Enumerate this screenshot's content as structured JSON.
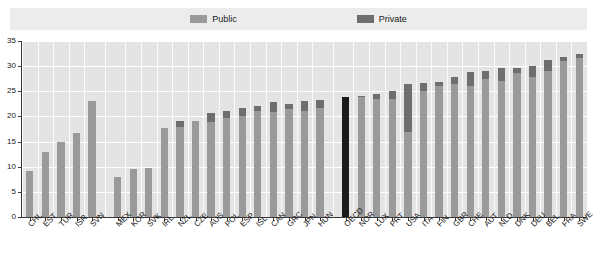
{
  "legend": {
    "entries": [
      {
        "label": "Public",
        "color": "#9a9a9a",
        "icon": "legend-swatch-public"
      },
      {
        "label": "Private",
        "color": "#6e6e6e",
        "icon": "legend-swatch-private"
      }
    ]
  },
  "colors": {
    "public": "#9a9a9a",
    "private": "#6e6e6e",
    "highlight": "#1a1a1a",
    "plot_background": "#e4e4e4",
    "gridline": "#ffffff",
    "axis": "#3a3a3a",
    "legend_background": "#ececec"
  },
  "chart_data": {
    "type": "bar",
    "title": "",
    "subtitle": "",
    "xlabel": "",
    "ylabel": "",
    "ylim": [
      0,
      35
    ],
    "yticks": [
      0,
      5,
      10,
      15,
      20,
      25,
      30,
      35
    ],
    "ytick_labels": [
      "0",
      "5",
      "10",
      "15",
      "20",
      "25",
      "30",
      "35"
    ],
    "grid": true,
    "grid_axis": "both",
    "legend_position": "top-center",
    "stacked": true,
    "highlight_category": "OECD",
    "categories": [
      "CHL",
      "EST",
      "TUR",
      "ISR",
      "SVN",
      "MEX",
      "KOR",
      "SVK",
      "IRL",
      "NZL",
      "CZE",
      "AUS",
      "POL",
      "ESP",
      "ISL",
      "CAN",
      "GRC",
      "JPN",
      "HUN",
      "OECD",
      "NOR",
      "LUX",
      "PRT",
      "USA",
      "ITA",
      "FIN",
      "GBR",
      "CHE",
      "AUT",
      "NLD",
      "DNK",
      "DEU",
      "BEL",
      "FRA",
      "SWE"
    ],
    "series": [
      {
        "name": "Public",
        "color": "#9a9a9a",
        "values": [
          9.2,
          13.0,
          15.0,
          16.8,
          23.0,
          8.0,
          9.6,
          9.7,
          17.8,
          17.9,
          19.0,
          18.9,
          19.6,
          20.1,
          21.0,
          20.8,
          21.4,
          21.0,
          21.6,
          20.6,
          23.8,
          23.5,
          23.4,
          17.0,
          25.0,
          26.1,
          26.5,
          26.0,
          27.4,
          27.1,
          28.7,
          27.8,
          29.0,
          31.0,
          31.6
        ]
      },
      {
        "name": "Private",
        "color": "#6e6e6e",
        "values": [
          0.0,
          0.0,
          0.0,
          0.0,
          0.0,
          0.0,
          0.0,
          0.0,
          0.0,
          1.1,
          0.0,
          1.7,
          1.4,
          1.6,
          1.1,
          2.1,
          1.0,
          2.0,
          1.6,
          3.2,
          0.2,
          1.0,
          1.6,
          9.4,
          1.6,
          0.8,
          1.3,
          2.9,
          1.6,
          2.6,
          1.0,
          2.2,
          2.2,
          0.9,
          0.9
        ]
      }
    ],
    "totals": [
      9.2,
      13.0,
      15.0,
      16.8,
      23.0,
      8.0,
      9.6,
      9.7,
      17.8,
      19.0,
      19.0,
      20.6,
      21.0,
      21.7,
      22.1,
      22.9,
      22.4,
      23.0,
      23.2,
      23.8,
      24.0,
      24.5,
      25.0,
      26.4,
      26.6,
      26.9,
      27.8,
      28.9,
      29.0,
      29.7,
      29.7,
      30.0,
      31.2,
      31.9,
      32.5
    ],
    "group_breaks": [
      5,
      19
    ]
  }
}
